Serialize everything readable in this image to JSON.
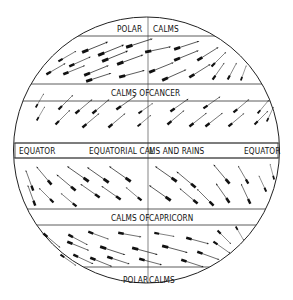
{
  "diagram": {
    "colors": {
      "line": "#222222",
      "arrow": "#111111",
      "background": "#ffffff"
    },
    "labels": {
      "polar_calms_north_left": "POLAR",
      "polar_calms_north_right": "CALMS",
      "calms_of_cancer_left": "CALMS OF",
      "calms_of_cancer_right": "CANCER",
      "equator_left": "EQUATOR",
      "equatorial_left": "EQUATORIAL CAL",
      "equatorial_right": "MS AND RAINS",
      "equator_right": "EQUATOR",
      "calms_of_capricorn_left": "CALMS OF",
      "calms_of_capricorn_right": "CAPRICORN",
      "polar_calms_south_left": "POLAR",
      "polar_calms_south_right": "CALMS"
    },
    "bands": [
      {
        "name": "Polar Calms (north)",
        "type": "calm"
      },
      {
        "name": "Westerlies (north)",
        "type": "wind",
        "direction": "toward upper-right (from SW)"
      },
      {
        "name": "Calms of Cancer",
        "type": "calm"
      },
      {
        "name": "NE Trade winds",
        "type": "wind",
        "direction": "toward lower-left... drawn tail lower-left, head upper-right"
      },
      {
        "name": "Equatorial Calms and Rains",
        "type": "calm"
      },
      {
        "name": "SE Trade winds",
        "type": "wind",
        "direction": "head upper-left, tail lower-right"
      },
      {
        "name": "Calms of Capricorn",
        "type": "calm"
      },
      {
        "name": "Westerlies (south)",
        "type": "wind",
        "direction": "head lower-right, tail upper-left"
      },
      {
        "name": "Polar Calms (south)",
        "type": "calm"
      }
    ]
  }
}
